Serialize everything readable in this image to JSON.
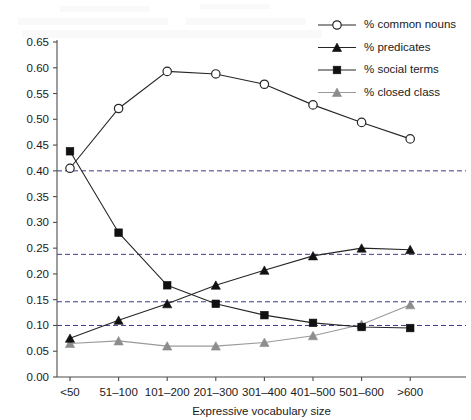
{
  "chart_data": {
    "type": "line",
    "title": "",
    "xlabel": "Expressive vocabulary size",
    "ylabel": "",
    "categories": [
      "<50",
      "51–100",
      "101–200",
      "201–300",
      "301–400",
      "401–500",
      "501–600",
      ">600"
    ],
    "ylim": [
      0.0,
      0.65
    ],
    "yticks": [
      "0.00",
      "0.05",
      "0.10",
      "0.15",
      "0.20",
      "0.25",
      "0.30",
      "0.35",
      "0.40",
      "0.45",
      "0.50",
      "0.55",
      "0.60",
      "0.65"
    ],
    "ytick_values": [
      0.0,
      0.05,
      0.1,
      0.15,
      0.2,
      0.25,
      0.3,
      0.35,
      0.4,
      0.45,
      0.5,
      0.55,
      0.6,
      0.65
    ],
    "grid": false,
    "legend_position": "top-right",
    "reference_lines": [
      0.4,
      0.238,
      0.146,
      0.1
    ],
    "series": [
      {
        "name": "% common nouns",
        "marker": "open-circle",
        "color": "#262626",
        "values": [
          0.405,
          0.521,
          0.593,
          0.588,
          0.568,
          0.528,
          0.494,
          0.462
        ]
      },
      {
        "name": "% predicates",
        "marker": "filled-triangle",
        "color": "#111111",
        "values": [
          0.075,
          0.11,
          0.142,
          0.178,
          0.207,
          0.235,
          0.25,
          0.247
        ]
      },
      {
        "name": "% social terms",
        "marker": "filled-square",
        "color": "#111111",
        "values": [
          0.438,
          0.28,
          0.178,
          0.142,
          0.12,
          0.105,
          0.097,
          0.095
        ]
      },
      {
        "name": "% closed class",
        "marker": "filled-triangle-gray",
        "color": "#8d8d8d",
        "values": [
          0.065,
          0.07,
          0.06,
          0.06,
          0.067,
          0.08,
          0.102,
          0.14
        ]
      }
    ]
  },
  "legend": {
    "items": [
      {
        "label": "% common nouns",
        "marker": "open-circle"
      },
      {
        "label": "% predicates",
        "marker": "filled-triangle"
      },
      {
        "label": "% social terms",
        "marker": "filled-square"
      },
      {
        "label": "% closed class",
        "marker": "filled-triangle-gray"
      }
    ]
  }
}
